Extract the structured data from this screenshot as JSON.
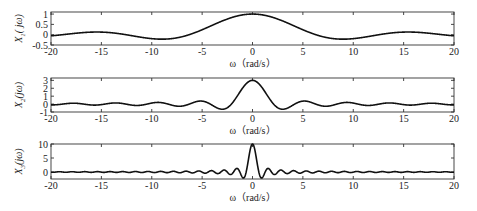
{
  "chart_data": [
    {
      "type": "line",
      "title": "",
      "ylabel": "X1(jω)",
      "ylabel_main": "X",
      "ylabel_sub": "1",
      "ylabel_tail": "( jω)",
      "xlabel": "ω（rad/s）",
      "xlim": [
        -20,
        20
      ],
      "ylim": [
        -0.5,
        1.1
      ],
      "xticks": [
        -20,
        -15,
        -10,
        -5,
        0,
        5,
        10,
        15,
        20
      ],
      "xtick_labels": [
        "-20",
        "-15",
        "-10",
        "-5",
        "0",
        "5",
        "10",
        "15",
        "20"
      ],
      "yticks": [
        -0.5,
        0,
        0.5,
        1
      ],
      "ytick_labels": [
        "-0.5",
        "0",
        "0.5",
        "1"
      ],
      "grid": false,
      "function": {
        "form": "2*sin(a*w)/w",
        "a": 0.5,
        "value_at_0": 1
      },
      "series": [
        {
          "name": "X1(jω)",
          "x": [
            0,
            1,
            2,
            3,
            4,
            5,
            6,
            7,
            8,
            9,
            10,
            11,
            12,
            13,
            14,
            15,
            16,
            17,
            18,
            19,
            20
          ],
          "y": [
            1,
            0.959,
            0.841,
            0.665,
            0.455,
            0.239,
            0.047,
            -0.1,
            -0.189,
            -0.217,
            -0.192,
            -0.128,
            -0.047,
            0.033,
            0.094,
            0.125,
            0.124,
            0.094,
            0.046,
            -0.008,
            -0.054
          ],
          "symmetry": "even"
        }
      ]
    },
    {
      "type": "line",
      "title": "",
      "ylabel": "X2(jω)",
      "ylabel_main": "X",
      "ylabel_sub": "2",
      "ylabel_tail": "(jω)",
      "xlabel": "ω（rad/s）",
      "xlim": [
        -20,
        20
      ],
      "ylim": [
        -1,
        3.3
      ],
      "xticks": [
        -20,
        -15,
        -10,
        -5,
        0,
        5,
        10,
        15,
        20
      ],
      "xtick_labels": [
        "-20",
        "-15",
        "-10",
        "-5",
        "0",
        "5",
        "10",
        "15",
        "20"
      ],
      "yticks": [
        -1,
        0,
        1,
        2,
        3
      ],
      "ytick_labels": [
        "-1",
        "0",
        "1",
        "2",
        "3"
      ],
      "grid": false,
      "function": {
        "form": "2*sin(a*w)/w",
        "a": 1.5,
        "value_at_0": 3
      },
      "series": [
        {
          "name": "X2(jω)",
          "x": [
            0,
            0.5,
            1,
            1.5,
            2,
            2.5,
            3,
            3.5,
            4,
            4.5,
            5,
            5.5,
            6,
            6.5,
            7,
            7.5,
            8,
            8.5,
            9,
            9.5,
            10
          ],
          "y": [
            3,
            2.727,
            1.995,
            1.038,
            0.141,
            -0.457,
            -0.652,
            -0.491,
            -0.14,
            0.2,
            0.375,
            0.333,
            0.137,
            -0.098,
            -0.251,
            -0.258,
            -0.134,
            0.052,
            0.179,
            0.209,
            0.13
          ],
          "symmetry": "even"
        }
      ]
    },
    {
      "type": "line",
      "title": "",
      "ylabel": "X3(jω)",
      "ylabel_main": "X",
      "ylabel_sub": "3",
      "ylabel_tail": "(jω)",
      "xlabel": "",
      "xlim": [
        -20,
        20
      ],
      "ylim": [
        -2.5,
        10
      ],
      "xticks": [
        -20,
        -15,
        -10,
        -5,
        0,
        5,
        10,
        15,
        20
      ],
      "xtick_labels": [
        "-20",
        "-15",
        "-10",
        "-5",
        "0",
        "5",
        "10",
        "15",
        "20"
      ],
      "yticks": [
        0,
        5,
        10
      ],
      "ytick_labels": [
        "0",
        "5",
        "10"
      ],
      "grid": false,
      "function": {
        "form": "2*sin(a*w)/w",
        "a": 5,
        "value_at_0": 10
      },
      "series": [
        {
          "name": "X3(jω)",
          "x": [
            0,
            0.25,
            0.5,
            0.75,
            1,
            1.25,
            1.5,
            1.75,
            2
          ],
          "y": [
            10,
            7.59,
            2.39,
            -1.53,
            -1.92,
            -0.05,
            1.25,
            0.74,
            -0.54
          ],
          "symmetry": "even"
        }
      ]
    }
  ]
}
